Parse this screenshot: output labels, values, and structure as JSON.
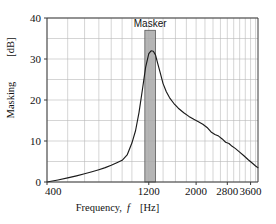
{
  "chart_data": {
    "type": "line",
    "title": "",
    "xlabel": "Frequency, f   [Hz]",
    "xlabel_main": "Frequency,",
    "xlabel_symbol": "f",
    "xlabel_unit": "[Hz]",
    "ylabel": "Masking   [dB]",
    "ylabel_main": "Masking",
    "ylabel_unit": "[dB]",
    "xscale": "log",
    "yscale": "linear",
    "xlim": [
      400,
      3900
    ],
    "ylim": [
      0,
      40
    ],
    "xticks": [
      400,
      1200,
      2000,
      2800,
      3600
    ],
    "xtick_labels": [
      "400",
      "1200",
      "2000",
      "2800",
      "3600"
    ],
    "yticks": [
      0,
      10,
      20,
      30,
      40
    ],
    "ytick_labels": [
      "0",
      "10",
      "20",
      "30",
      "40"
    ],
    "y_gridlines": [
      0,
      5,
      10,
      15,
      20,
      25,
      30,
      35,
      40
    ],
    "x_gridlines": [
      400,
      500,
      600,
      700,
      800,
      900,
      1000,
      1200,
      1400,
      1600,
      1800,
      2000,
      2200,
      2400,
      2600,
      2800,
      3000,
      3200,
      3400,
      3600,
      3800
    ],
    "grid": true,
    "legend": "none",
    "curve_color": "#1b1b1b",
    "grid_color": "#b9b9b9",
    "axis_color": "#3a3a3a",
    "masker_color": "#a8a8a8",
    "annotations": [
      {
        "name": "masker",
        "label": "Masker",
        "freq_low": 1150,
        "freq_high": 1290,
        "level_db": 37.0
      }
    ],
    "series": [
      {
        "name": "masking threshold",
        "x": [
          400,
          450,
          500,
          550,
          600,
          650,
          700,
          750,
          800,
          850,
          900,
          950,
          1000,
          1040,
          1080,
          1120,
          1160,
          1200,
          1230,
          1260,
          1290,
          1320,
          1360,
          1400,
          1450,
          1500,
          1570,
          1650,
          1750,
          1850,
          1950,
          2050,
          2150,
          2250,
          2350,
          2450,
          2550,
          2650,
          2750,
          2850,
          2950,
          3050,
          3200,
          3350,
          3500,
          3650,
          3800,
          3900
        ],
        "y": [
          0.0,
          0.5,
          1.0,
          1.5,
          2.0,
          2.5,
          3.0,
          3.5,
          4.1,
          4.7,
          5.3,
          6.6,
          9.5,
          12.5,
          17.0,
          22.5,
          28.0,
          31.3,
          32.0,
          31.9,
          31.0,
          29.0,
          26.5,
          24.0,
          22.0,
          20.6,
          19.2,
          18.0,
          16.9,
          16.0,
          15.3,
          14.7,
          14.1,
          13.3,
          12.2,
          11.6,
          11.2,
          10.5,
          9.7,
          9.4,
          8.7,
          8.2,
          7.3,
          6.4,
          5.5,
          4.7,
          3.9,
          3.5
        ]
      }
    ]
  },
  "layout": {
    "plot_left": 47,
    "plot_right": 258,
    "plot_top": 18,
    "plot_bottom": 182
  }
}
